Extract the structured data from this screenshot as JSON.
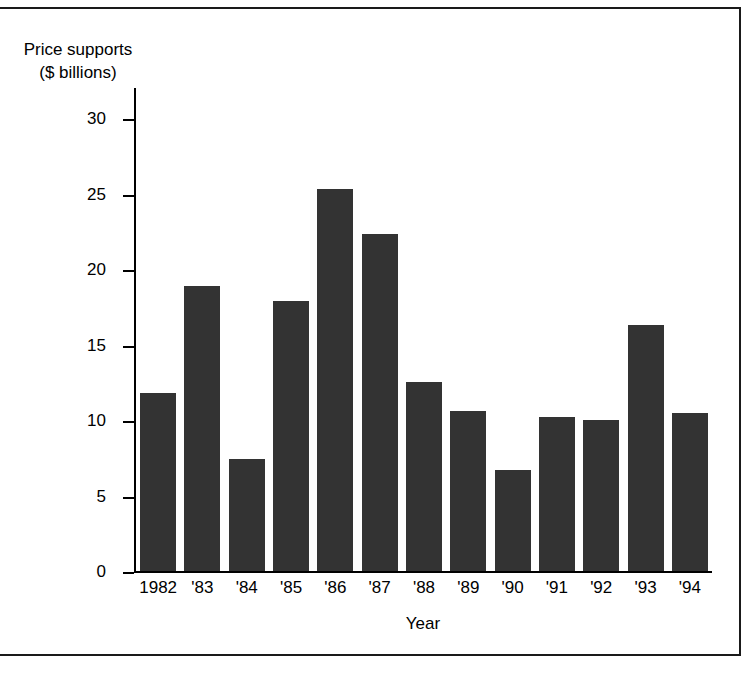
{
  "figure": {
    "ylabel_text": "Price supports\n($ billions)",
    "xlabel_text": "Year"
  },
  "chart_data": {
    "type": "bar",
    "title": "",
    "xlabel": "Year",
    "ylabel": "Price supports ($ billions)",
    "categories": [
      "1982",
      "'83",
      "'84",
      "'85",
      "'86",
      "'87",
      "'88",
      "'89",
      "'90",
      "'91",
      "'92",
      "'93",
      "'94"
    ],
    "values": [
      11.8,
      18.9,
      7.4,
      17.9,
      25.3,
      22.3,
      12.5,
      10.6,
      6.7,
      10.2,
      10.0,
      16.3,
      10.5
    ],
    "ylim": [
      0,
      32
    ],
    "yticks": [
      0,
      5,
      10,
      15,
      20,
      25,
      30
    ],
    "ytick_labels": [
      "0",
      "5",
      "10",
      "15",
      "20",
      "25",
      "30"
    ],
    "grid": false,
    "legend": null,
    "bar_color": "#333333",
    "axis_color": "#000000"
  }
}
